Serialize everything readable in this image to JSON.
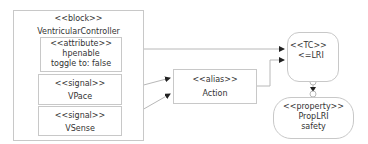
{
  "block": {
    "stereotype": "<<block>>",
    "name": "VentricularController"
  },
  "attribute": {
    "stereotype": "<<attribute>>",
    "name": "hpenable",
    "detail": "toggle to: false"
  },
  "signals": [
    {
      "stereotype": "<<signal>>",
      "name": "VPace"
    },
    {
      "stereotype": "<<signal>>",
      "name": "VSense"
    }
  ],
  "alias": {
    "stereotype": "<<alias>>",
    "name": "Action"
  },
  "tc": {
    "stereotype": "<<TC>>",
    "name": "<=LRI"
  },
  "property": {
    "stereotype": "<<property>>",
    "name": "PropLRI",
    "detail": "safety"
  },
  "colors": {
    "border": "#c8c8c8",
    "line": "#b0b0b0",
    "arrow": "#222222",
    "text": "#333333"
  }
}
